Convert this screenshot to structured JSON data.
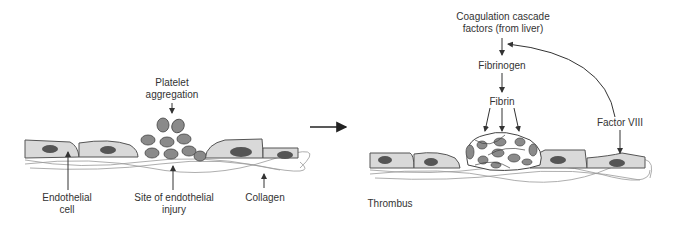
{
  "left_panel": {
    "labels": {
      "platelet_aggregation": "Platelet\naggregation",
      "endothelial_cell": "Endothelial\ncell",
      "injury_site": "Site of endothelial\ninjury",
      "collagen": "Collagen"
    }
  },
  "right_panel": {
    "labels": {
      "coagulation": "Coagulation cascade\nfactors (from liver)",
      "fibrinogen": "Fibrinogen",
      "fibrin": "Fibrin",
      "factor_viii": "Factor VIII",
      "thrombus": "Thrombus"
    }
  },
  "colors": {
    "cell_fill": "#d9d9d9",
    "nucleus": "#555555",
    "platelet": "#8a8a8a",
    "line": "#333333"
  }
}
